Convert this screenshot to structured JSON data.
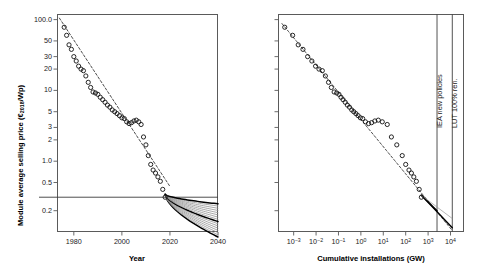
{
  "figure": {
    "title": "",
    "panels": [
      "left",
      "right"
    ]
  },
  "chart_data": [
    {
      "panel": "left",
      "type": "scatter",
      "title": "",
      "xlabel": "Year",
      "ylabel": "Module average selling price (€2018/Wp)",
      "ylabel_parts": {
        "pre": "Module average selling price (€",
        "sub": "2018",
        "post": "/Wp)"
      },
      "xscale": "linear",
      "yscale": "log",
      "xlim": [
        1973,
        2040
      ],
      "ylim": [
        0.1,
        120
      ],
      "grid": false,
      "legend": null,
      "xticks": [
        1980,
        2000,
        2020,
        2040
      ],
      "xtick_labels": [
        "1980",
        "2000",
        "2020",
        "2040"
      ],
      "yticks": [
        100,
        50,
        30,
        20,
        10,
        5,
        3,
        2,
        1.0,
        0.5,
        0.2
      ],
      "ytick_labels": [
        "100.0",
        "50",
        "30",
        "20",
        "10",
        "5",
        "3",
        "2",
        "1.0",
        "0.5",
        "0.2"
      ],
      "marker": "open-circle",
      "trend_line_style": "dashed",
      "reference_line": {
        "orientation": "horizontal",
        "value": 0.31,
        "label": ""
      },
      "x": [
        1976,
        1977,
        1978,
        1979,
        1980,
        1981,
        1982,
        1983,
        1984,
        1985,
        1986,
        1987,
        1988,
        1989,
        1990,
        1991,
        1992,
        1993,
        1994,
        1995,
        1996,
        1997,
        1998,
        1999,
        2000,
        2001,
        2002,
        2003,
        2004,
        2005,
        2006,
        2007,
        2008,
        2009,
        2010,
        2011,
        2012,
        2013,
        2014,
        2015,
        2016,
        2017,
        2018
      ],
      "y": [
        78,
        60,
        44,
        38,
        30,
        26,
        22,
        20,
        19,
        16,
        13,
        11,
        9.5,
        9.2,
        8.8,
        8.0,
        7.4,
        6.8,
        6.2,
        5.8,
        5.3,
        5.0,
        4.7,
        4.4,
        4.1,
        4.0,
        3.6,
        3.4,
        3.5,
        3.7,
        3.8,
        3.6,
        3.3,
        2.2,
        1.7,
        1.2,
        0.9,
        0.75,
        0.68,
        0.6,
        0.52,
        0.4,
        0.31
      ],
      "projection": {
        "start_year": 2018,
        "end_year": 2040,
        "start_value": 0.34,
        "upper_end_value": 0.25,
        "lower_end_value": 0.085,
        "fan_line_count": 16,
        "fan_colors": [
          "#000000",
          "#8c8c8c"
        ]
      }
    },
    {
      "panel": "right",
      "type": "scatter",
      "title": "",
      "xlabel": "Cumulative installations (GW)",
      "ylabel": "",
      "xscale": "log",
      "yscale": "log",
      "xlim": [
        0.0002,
        40000
      ],
      "ylim": [
        0.1,
        120
      ],
      "grid": false,
      "legend": null,
      "xticks": [
        0.001,
        0.01,
        0.1,
        1,
        10,
        100,
        1000,
        10000
      ],
      "xtick_labels": [
        "10−3",
        "10−2",
        "10−1",
        "10⁰",
        "10¹",
        "10²",
        "10³",
        "10⁴"
      ],
      "xtick_bases": [
        "10",
        "10",
        "10",
        "10",
        "10",
        "10",
        "10",
        "10"
      ],
      "xtick_exponents": [
        "−3",
        "−2",
        "−1",
        "0",
        "1",
        "2",
        "3",
        "4"
      ],
      "yticks_unlabeled": true,
      "marker": "open-circle",
      "trend_line_style": "dashed",
      "x": [
        0.0004,
        0.0009,
        0.0016,
        0.0026,
        0.0042,
        0.0065,
        0.0095,
        0.0135,
        0.019,
        0.026,
        0.036,
        0.048,
        0.064,
        0.083,
        0.105,
        0.13,
        0.16,
        0.2,
        0.25,
        0.31,
        0.39,
        0.48,
        0.6,
        0.75,
        0.95,
        1.2,
        1.6,
        2.2,
        3.0,
        4.2,
        6.0,
        9.0,
        15,
        23,
        40,
        70,
        100,
        140,
        180,
        230,
        300,
        400,
        500
      ],
      "y": [
        78,
        60,
        44,
        38,
        30,
        26,
        22,
        20,
        19,
        16,
        13,
        11,
        9.5,
        9.2,
        8.8,
        8.0,
        7.4,
        6.8,
        6.2,
        5.8,
        5.3,
        5.0,
        4.7,
        4.4,
        4.1,
        4.0,
        3.6,
        3.4,
        3.5,
        3.7,
        3.8,
        3.6,
        3.3,
        2.2,
        1.7,
        1.2,
        0.9,
        0.75,
        0.68,
        0.6,
        0.52,
        0.4,
        0.31
      ],
      "vertical_markers": [
        {
          "name": "iea-new-policies",
          "label": "IEA new policies",
          "value": 2500
        },
        {
          "name": "lut-100-renewable",
          "label": "LUT 100% ren.",
          "value": 12000
        }
      ],
      "projection": {
        "start_x": 500,
        "end_x": 12000,
        "start_value": 0.33,
        "upper_end_value": 0.2,
        "lower_end_value": 0.115
      }
    }
  ]
}
